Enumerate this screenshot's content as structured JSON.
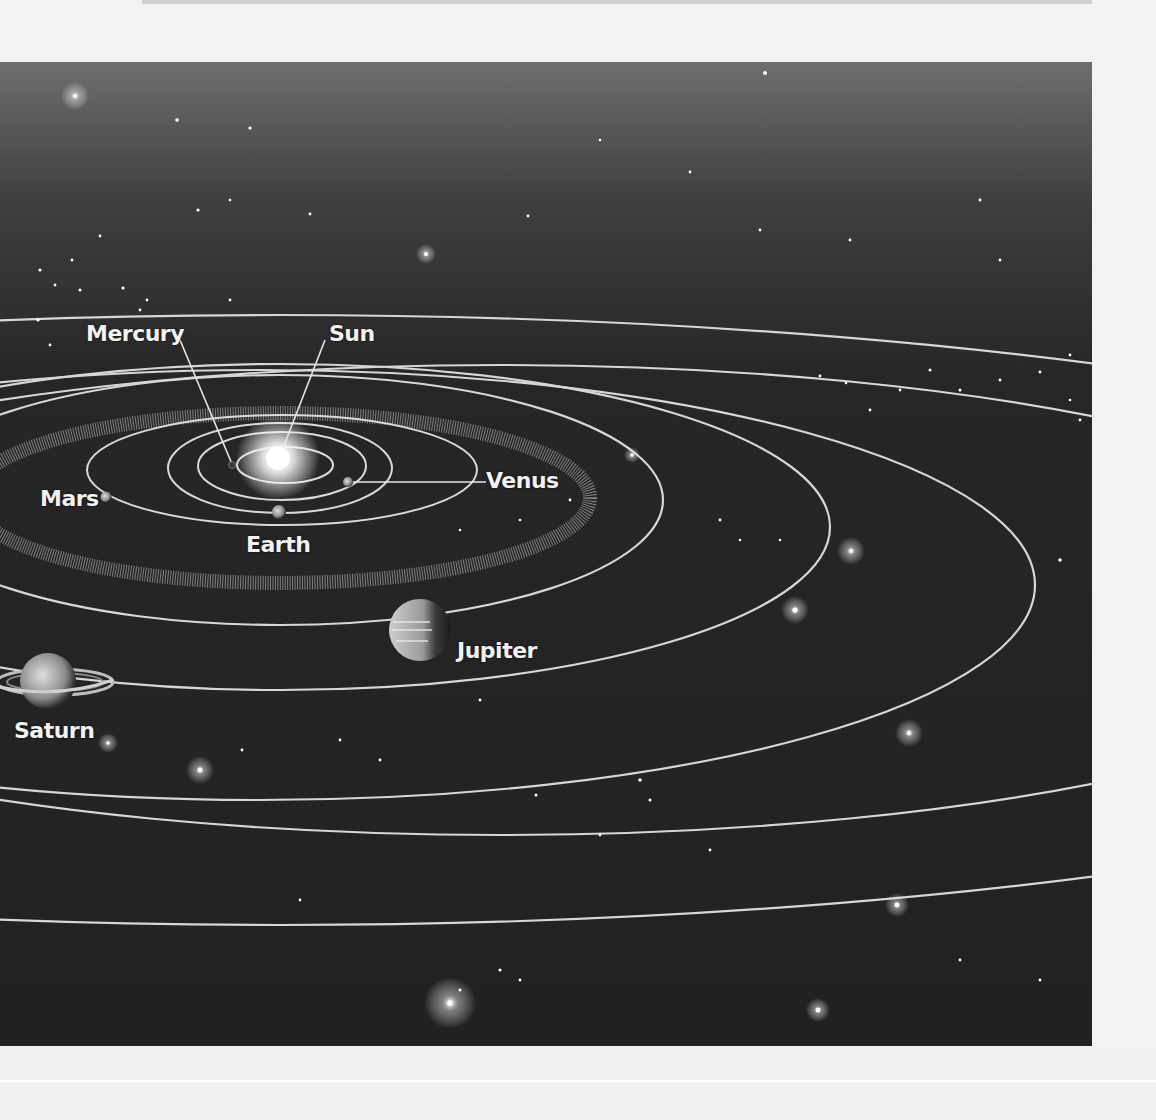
{
  "figure": {
    "colors": {
      "background_page": "#f3f3f3",
      "space": "#222222",
      "orbit": "#d8d8d8",
      "label": "#f2f2f2"
    },
    "labels": {
      "sun": "Sun",
      "mercury": "Mercury",
      "venus": "Venus",
      "earth": "Earth",
      "mars": "Mars",
      "jupiter": "Jupiter",
      "saturn": "Saturn"
    }
  }
}
